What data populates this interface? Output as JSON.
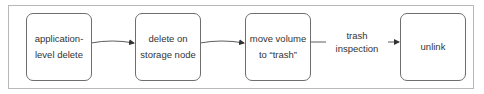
{
  "diagram": {
    "type": "flowchart",
    "direction": "left-to-right",
    "nodes": [
      {
        "id": "n1",
        "lines": [
          "application-",
          "level delete"
        ]
      },
      {
        "id": "n2",
        "lines": [
          "delete on",
          "storage node"
        ]
      },
      {
        "id": "n3",
        "lines": [
          "move volume",
          "to “trash”"
        ]
      },
      {
        "id": "n4",
        "lines": [
          "unlink"
        ]
      }
    ],
    "edges": [
      {
        "from": "n1",
        "to": "n2",
        "label": ""
      },
      {
        "from": "n2",
        "to": "n3",
        "label": ""
      },
      {
        "from": "n3",
        "to": "n4",
        "label_lines": [
          "trash",
          "inspection"
        ]
      }
    ],
    "colors": {
      "node_border": "#6e6e6e",
      "frame_border": "#b8b8b8",
      "edge": "#333333",
      "text": "#333333"
    }
  }
}
